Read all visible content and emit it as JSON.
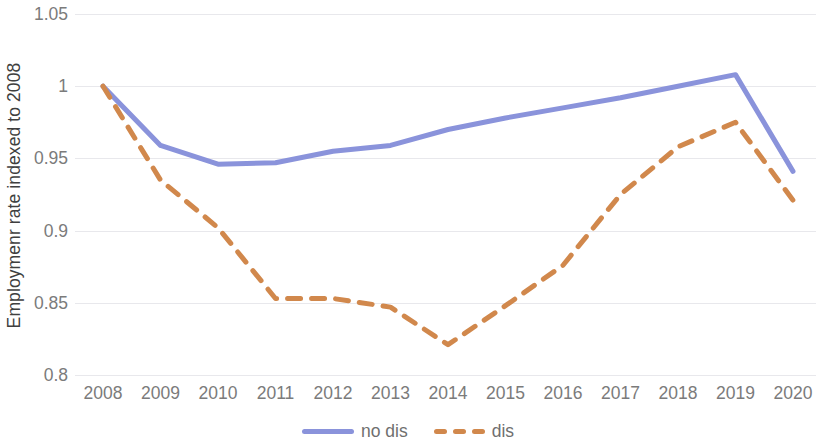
{
  "chart_data": {
    "type": "line",
    "title": "",
    "xlabel": "",
    "ylabel": "Employmenr rate indexed to 2008",
    "categories": [
      "2008",
      "2009",
      "2010",
      "2011",
      "2012",
      "2013",
      "2014",
      "2015",
      "2016",
      "2017",
      "2018",
      "2019",
      "2020"
    ],
    "x": [
      2008,
      2009,
      2010,
      2011,
      2012,
      2013,
      2014,
      2015,
      2016,
      2017,
      2018,
      2019,
      2020
    ],
    "ylim": [
      0.8,
      1.05
    ],
    "ytick_labels": [
      "1.05",
      "1",
      "0.95",
      "0.9",
      "0.85",
      "0.8"
    ],
    "ytick_values": [
      1.05,
      1.0,
      0.95,
      0.9,
      0.85,
      0.8
    ],
    "grid": true,
    "legend_position": "bottom",
    "series": [
      {
        "name": "no dis",
        "style": "solid",
        "color": "#8a93db",
        "values": [
          1.0,
          0.959,
          0.946,
          0.947,
          0.955,
          0.959,
          0.97,
          0.978,
          0.985,
          0.992,
          1.0,
          1.008,
          0.941
        ]
      },
      {
        "name": "dis",
        "style": "dashed",
        "color": "#d1884c",
        "values": [
          1.0,
          0.935,
          0.902,
          0.853,
          0.853,
          0.847,
          0.821,
          0.848,
          0.876,
          0.925,
          0.958,
          0.975,
          0.921
        ]
      }
    ]
  },
  "legend": {
    "entries": [
      {
        "label": "no dis",
        "color": "#8a93db",
        "style": "solid"
      },
      {
        "label": "dis",
        "color": "#d1884c",
        "style": "dashed"
      }
    ]
  },
  "colors": {
    "no_dis": "#8a93db",
    "dis": "#d1884c",
    "gridline": "#e8e8ec",
    "tick_text": "#7b7b7b",
    "axis_title_text": "#3f3f3f",
    "background": "#ffffff"
  }
}
